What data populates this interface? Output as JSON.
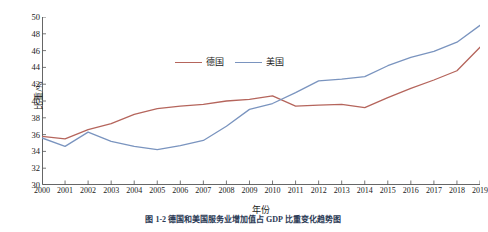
{
  "chart_data": {
    "type": "line",
    "title": "",
    "xlabel": "年份",
    "ylabel": "比重/%",
    "x": [
      2000,
      2001,
      2002,
      2003,
      2004,
      2005,
      2006,
      2007,
      2008,
      2009,
      2010,
      2011,
      2012,
      2013,
      2014,
      2015,
      2016,
      2017,
      2018,
      2019
    ],
    "xlim": [
      2000,
      2019
    ],
    "ylim": [
      30,
      50
    ],
    "yticks": [
      30,
      32,
      34,
      36,
      38,
      40,
      42,
      44,
      46,
      48,
      50
    ],
    "xticks": [
      "2000",
      "2001",
      "2002",
      "2003",
      "2004",
      "2005",
      "2006",
      "2007",
      "2008",
      "2009",
      "2010",
      "2011",
      "2012",
      "2013",
      "2014",
      "2015",
      "2016",
      "2017",
      "2018",
      "2019"
    ],
    "grid": false,
    "legend_position": "top-center",
    "series": [
      {
        "name": "德国",
        "color": "#b5655c",
        "values": [
          35.8,
          35.5,
          36.6,
          37.3,
          38.4,
          39.1,
          39.4,
          39.6,
          40.0,
          40.2,
          40.6,
          39.4,
          39.5,
          39.6,
          39.2,
          40.4,
          41.5,
          42.5,
          43.6,
          46.4
        ]
      },
      {
        "name": "美国",
        "color": "#7a94bf",
        "values": [
          35.6,
          34.6,
          36.3,
          35.2,
          34.6,
          34.2,
          34.7,
          35.3,
          37.0,
          39.0,
          39.7,
          41.0,
          42.4,
          42.6,
          42.9,
          44.2,
          45.2,
          45.9,
          47.0,
          49.0
        ]
      }
    ]
  },
  "legend": {
    "items": [
      {
        "label": "德国",
        "color": "#b5655c"
      },
      {
        "label": "美国",
        "color": "#7a94bf"
      }
    ]
  },
  "caption": {
    "text": "图 1-2  德国和美国服务业增加值占 GDP 比重变化趋势图"
  }
}
